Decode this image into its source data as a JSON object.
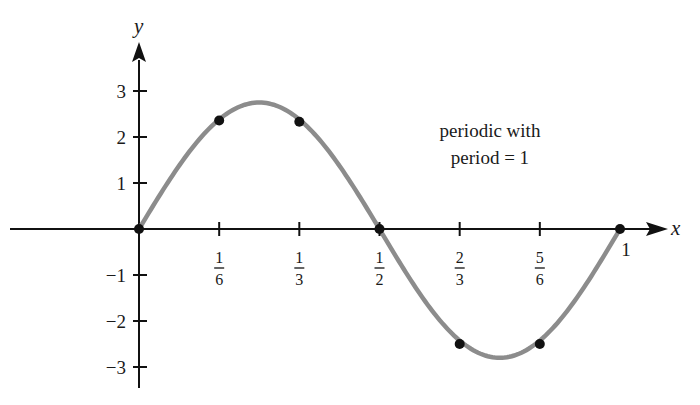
{
  "chart_data": {
    "type": "line",
    "title": "",
    "xlabel": "x",
    "ylabel": "y",
    "xlim": [
      -0.27,
      1.08
    ],
    "ylim": [
      -3.4,
      4.3
    ],
    "grid": false,
    "legend": null,
    "x_ticks": [
      {
        "value": 0.1667,
        "label": "1/6",
        "num": "1",
        "den": "6"
      },
      {
        "value": 0.3333,
        "label": "1/3",
        "num": "1",
        "den": "3"
      },
      {
        "value": 0.5,
        "label": "1/2",
        "num": "1",
        "den": "2"
      },
      {
        "value": 0.6667,
        "label": "2/3",
        "num": "2",
        "den": "3"
      },
      {
        "value": 0.8333,
        "label": "5/6",
        "num": "5",
        "den": "6"
      },
      {
        "value": 1,
        "label": "1"
      }
    ],
    "y_ticks": [
      {
        "value": 3,
        "label": "3"
      },
      {
        "value": 2,
        "label": "2"
      },
      {
        "value": 1,
        "label": "1"
      },
      {
        "value": -1,
        "label": "−1"
      },
      {
        "value": -2,
        "label": "−2"
      },
      {
        "value": -3,
        "label": "−3"
      }
    ],
    "series": [
      {
        "name": "periodic function",
        "color": "#8c8c8c",
        "curve": "approximately 2.77*sin(2*pi*x) on [0,1]",
        "x": [
          0,
          0.1667,
          0.25,
          0.3333,
          0.5,
          0.6667,
          0.75,
          0.8333,
          1
        ],
        "y": [
          0,
          2.36,
          2.75,
          2.33,
          0,
          -2.5,
          -2.8,
          -2.5,
          0
        ]
      }
    ],
    "marked_points": [
      {
        "x": 0,
        "y": 0
      },
      {
        "x": 0.1667,
        "y": 2.36
      },
      {
        "x": 0.3333,
        "y": 2.33
      },
      {
        "x": 0.5,
        "y": 0
      },
      {
        "x": 0.6667,
        "y": -2.5
      },
      {
        "x": 0.8333,
        "y": -2.5
      },
      {
        "x": 1,
        "y": 0
      }
    ],
    "annotations": [
      {
        "text": "periodic with period = 1",
        "lines": [
          "periodic with",
          "period = 1"
        ],
        "x": 0.76,
        "y": 1.75
      }
    ]
  },
  "annotation": {
    "line1": "periodic with",
    "line2": "period = 1"
  }
}
